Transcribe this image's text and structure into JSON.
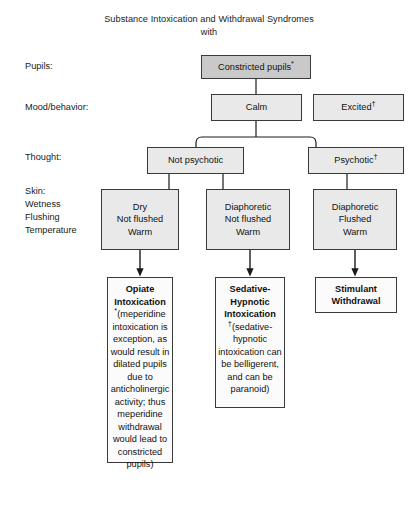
{
  "title": {
    "line1": "Substance Intoxication and Withdrawal Syndromes",
    "line2": "with"
  },
  "row_labels": {
    "pupils": "Pupils:",
    "mood": "Mood/behavior:",
    "thought": "Thought:",
    "skin_line1": "Skin:",
    "skin_line2": "Wetness",
    "skin_line3": "Flushing",
    "skin_line4": "Temperature"
  },
  "nodes": {
    "pupils": {
      "label": "Constricted pupils",
      "marker": "*"
    },
    "mood_calm": {
      "label": "Calm",
      "marker": ""
    },
    "mood_excited": {
      "label": "Excited",
      "marker": "†"
    },
    "thought_not_psychotic": {
      "label": "Not psychotic",
      "marker": ""
    },
    "thought_psychotic": {
      "label": "Psychotic",
      "marker": "†"
    },
    "skin_left": {
      "line1": "Dry",
      "line2": "Not flushed",
      "line3": "Warm"
    },
    "skin_middle": {
      "line1": "Diaphoretic",
      "line2": "Not flushed",
      "line3": "Warm"
    },
    "skin_right": {
      "line1": "Diaphoretic",
      "line2": "Flushed",
      "line3": "Warm"
    },
    "outcome_left": {
      "heading": "Opiate Intoxication",
      "marker": "*",
      "note": "(meperidine intoxication is exception, as would result in dilated pupils due to anticholinergic activity; thus meperidine withdrawal would lead to constricted pupils)"
    },
    "outcome_middle": {
      "heading": "Sedative- Hypnotic Intoxication",
      "marker": "†",
      "note": "(sedative-hypnotic intoxication can be belligerent, and can be paranoid)"
    },
    "outcome_right": {
      "heading": "Stimulant Withdrawal",
      "marker": "",
      "note": ""
    }
  },
  "colors": {
    "background": "#ffffff",
    "box_fill_light": "#e9e9e9",
    "box_fill_dark": "#c9c9c9",
    "box_fill_white": "#fbfbfb",
    "border": "#3a3a3a",
    "text": "#1a1a1a"
  }
}
